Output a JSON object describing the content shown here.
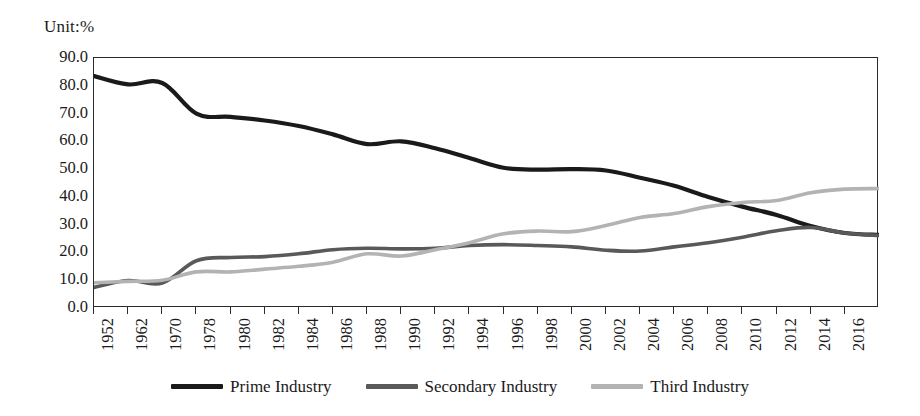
{
  "unit_label": "Unit:%",
  "axes": {
    "y_ticks": [
      "0.0",
      "10.0",
      "20.0",
      "30.0",
      "40.0",
      "50.0",
      "60.0",
      "70.0",
      "80.0",
      "90.0"
    ],
    "y_min": 0,
    "y_max": 90,
    "x_labels": [
      "1952",
      "1962",
      "1970",
      "1978",
      "1980",
      "1982",
      "1984",
      "1986",
      "1988",
      "1990",
      "1992",
      "1994",
      "1996",
      "1998",
      "2000",
      "2002",
      "2004",
      "2006",
      "2008",
      "2010",
      "2012",
      "2014",
      "2016"
    ]
  },
  "legend": {
    "position": "bottom-center",
    "items": [
      {
        "label": "Prime Industry",
        "color": "#1a1a1a"
      },
      {
        "label": "Secondary Industry",
        "color": "#595959"
      },
      {
        "label": "Third Industry",
        "color": "#b3b3b3"
      }
    ]
  },
  "chart_data": {
    "type": "line",
    "title": "",
    "subtitle": "",
    "xlabel": "",
    "ylabel": "Unit:%",
    "ylim": [
      0,
      90
    ],
    "ytick_step": 10,
    "grid": false,
    "legend_position": "bottom-center",
    "categories": [
      "1952",
      "1962",
      "1970",
      "1978",
      "1980",
      "1982",
      "1984",
      "1986",
      "1988",
      "1990",
      "1992",
      "1994",
      "1996",
      "1998",
      "2000",
      "2002",
      "2004",
      "2006",
      "2008",
      "2010",
      "2012",
      "2014",
      "2016",
      "2017"
    ],
    "series": [
      {
        "name": "Prime Industry",
        "color": "#1a1a1a",
        "values": [
          83.5,
          80.5,
          81.0,
          70.0,
          68.8,
          67.5,
          65.5,
          62.5,
          59.0,
          60.0,
          57.5,
          54.0,
          50.5,
          49.8,
          50.0,
          49.5,
          46.9,
          44.0,
          40.0,
          36.5,
          33.5,
          29.5,
          27.0,
          26.3
        ]
      },
      {
        "name": "Secondary Industry",
        "color": "#595959",
        "values": [
          7.4,
          9.9,
          9.0,
          17.0,
          18.2,
          18.5,
          19.5,
          21.0,
          21.5,
          21.3,
          21.5,
          22.5,
          22.8,
          22.5,
          22.0,
          20.8,
          20.5,
          22.0,
          23.5,
          25.5,
          27.8,
          29.0,
          27.0,
          26.1
        ]
      },
      {
        "name": "Third Industry",
        "color": "#b3b3b3",
        "values": [
          9.1,
          9.6,
          10.0,
          13.0,
          13.0,
          14.0,
          15.0,
          16.5,
          19.5,
          18.7,
          21.0,
          23.5,
          26.7,
          27.7,
          27.5,
          29.7,
          32.6,
          34.0,
          36.5,
          38.0,
          38.7,
          41.5,
          42.8,
          43.0
        ]
      }
    ]
  }
}
